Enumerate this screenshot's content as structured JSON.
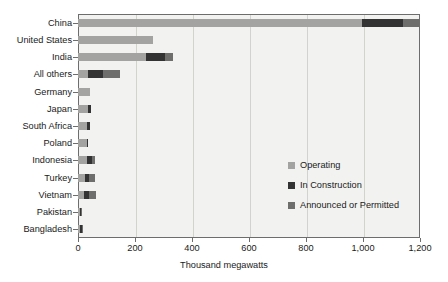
{
  "chart_data": {
    "type": "bar",
    "orientation": "horizontal",
    "stacked": true,
    "title": "",
    "xlabel": "Thousand megawatts",
    "ylabel": "",
    "xlim": [
      0,
      1200
    ],
    "xticks": [
      0,
      200,
      400,
      600,
      800,
      1000,
      1200
    ],
    "xtick_labels": [
      "0",
      "200",
      "400",
      "600",
      "800",
      "1,000",
      "1,200"
    ],
    "grid": "vertical",
    "legend_position": "inside-right",
    "categories": [
      "China",
      "United States",
      "India",
      "All others",
      "Germany",
      "Japan",
      "South Africa",
      "Poland",
      "Indonesia",
      "Turkey",
      "Vietnam",
      "Pakistan",
      "Bangladesh"
    ],
    "series": [
      {
        "name": "Operating",
        "color": "#a3a3a1",
        "values": [
          996,
          263,
          238,
          35,
          42,
          35,
          32,
          30,
          30,
          25,
          22,
          6,
          8
        ]
      },
      {
        "name": "In Construction",
        "color": "#333333",
        "values": [
          144,
          0,
          67,
          53,
          0,
          9,
          11,
          5,
          18,
          12,
          15,
          4,
          5
        ]
      },
      {
        "name": "Announced or Permitted",
        "color": "#6e6e6c",
        "values": [
          60,
          0,
          28,
          60,
          0,
          0,
          0,
          0,
          12,
          22,
          27,
          1,
          2
        ]
      }
    ]
  },
  "legend": {
    "items": [
      {
        "label": "Operating",
        "color": "#a3a3a1"
      },
      {
        "label": "In Construction",
        "color": "#333333"
      },
      {
        "label": "Announced or Permitted",
        "color": "#6e6e6c"
      }
    ]
  },
  "axes": {
    "x_title": "Thousand megawatts"
  },
  "colors": {
    "plot_background": "#f2f2f0",
    "frame": "#6d6d6d",
    "gridline": "#d2d2cf",
    "text": "#1a1a1a"
  }
}
